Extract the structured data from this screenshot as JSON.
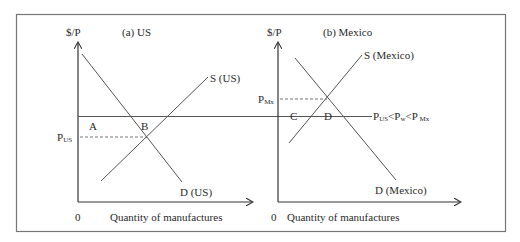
{
  "diagram": {
    "type": "two-panel supply-demand trade diagram",
    "panels": [
      {
        "id": "us",
        "title": "(a) US",
        "y_axis_label": "$/P",
        "x_axis_label": "Quantity of manufactures",
        "origin_label": "0",
        "supply_label": "S (US)",
        "demand_label": "D (US)",
        "equilibrium_price_label": "P",
        "equilibrium_price_subscript": "US",
        "area_labels": [
          "A",
          "B"
        ]
      },
      {
        "id": "mexico",
        "title": "(b) Mexico",
        "y_axis_label": "$/P",
        "x_axis_label": "Quantity of manufactures",
        "origin_label": "0",
        "supply_label": "S (Mexico)",
        "demand_label": "D (Mexico)",
        "equilibrium_price_label": "P",
        "equilibrium_price_subscript": "Mx",
        "area_labels": [
          "C",
          "D"
        ]
      }
    ],
    "world_price_label": {
      "p1": "P",
      "s1": "US",
      "lt1": "<",
      "p2": "P",
      "s2": "w",
      "lt2": "<",
      "p3": "P",
      "s3": " Mx"
    }
  }
}
